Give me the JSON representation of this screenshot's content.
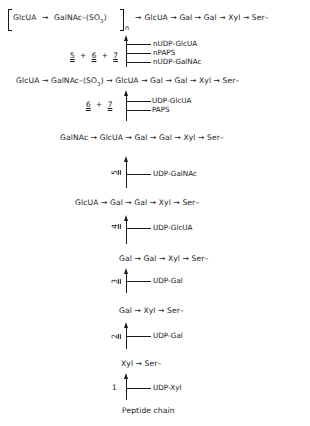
{
  "diagram": {
    "type": "biosynthesis-pathway",
    "arrow_glyph": "→",
    "rows": [
      {
        "id": "row8",
        "items": [
          "GlcUA",
          "GalNAc–(SO3)",
          "GlcUA",
          "Gal",
          "Gal",
          "Xyl",
          "Ser–"
        ],
        "repeat_subscript": "n"
      },
      {
        "id": "row7",
        "items": [
          "GlcUA",
          "GalNAc–(SO3)",
          "GlcUA",
          "Gal",
          "Gal",
          "Xyl",
          "Ser–"
        ]
      },
      {
        "id": "row6",
        "items": [
          "GalNAc",
          "GlcUA",
          "Gal",
          "Gal",
          "Xyl",
          "Ser–"
        ]
      },
      {
        "id": "row5",
        "items": [
          "GlcUA",
          "Gal",
          "Gal",
          "Xyl",
          "Ser–"
        ]
      },
      {
        "id": "row4",
        "items": [
          "Gal",
          "Gal",
          "Xyl",
          "Ser–"
        ]
      },
      {
        "id": "row3",
        "items": [
          "Gal",
          "Xyl",
          "Ser–"
        ]
      },
      {
        "id": "row2",
        "items": [
          "Xyl",
          "Ser–"
        ]
      },
      {
        "id": "row1",
        "label": "Peptide chain"
      }
    ],
    "steps": [
      {
        "enzyme": "5 + 6 + 7",
        "substrates": [
          "nUDP-GlcUA",
          "nPAPS",
          "nUDP-GalNAc"
        ]
      },
      {
        "enzyme": "6 + 7",
        "substrates": [
          "UDP-GlcUA",
          "PAPS"
        ]
      },
      {
        "enzyme": "5",
        "substrates": [
          "UDP-GalNAc"
        ]
      },
      {
        "enzyme": "4",
        "substrates": [
          "UDP-GlcUA"
        ]
      },
      {
        "enzyme": "3",
        "substrates": [
          "UDP-Gal"
        ]
      },
      {
        "enzyme": "2",
        "substrates": [
          "UDP-Gal"
        ]
      },
      {
        "enzyme": "1",
        "substrates": [
          "UDP-Xyl"
        ]
      }
    ]
  },
  "text": {
    "r8_a": "GlcUA",
    "r8_b": "GalNAc–(SO",
    "r8_b_sub": "3",
    "r8_b_end": ")",
    "r8_n": "n",
    "r8_rest": "GlcUA → Gal → Gal → Xyl → Ser–",
    "r7": "GlcUA → GalNAc–(SO",
    "r7_sub": "3",
    "r7_rest": ") → GlcUA → Gal → Gal → Xyl → Ser–",
    "r6": "GalNAc → GlcUA → Gal → Gal → Xyl → Ser–",
    "r5": "GlcUA → Gal → Gal → Xyl → Ser–",
    "r4": "Gal → Gal → Xyl → Ser–",
    "r3": "Gal → Xyl → Ser–",
    "r2": "Xyl → Ser–",
    "r1": "Peptide chain",
    "s7_n1": "5",
    "s7_plus1": "+",
    "s7_n2": "6",
    "s7_plus2": "+",
    "s7_n3": "7",
    "s7_l1": "nUDP-GlcUA",
    "s7_l2": "nPAPS",
    "s7_l3": "nUDP-GalNAc",
    "s6_n1": "6",
    "s6_plus": "+",
    "s6_n2": "7",
    "s6_l1": "UDP-GlcUA",
    "s6_l2": "PAPS",
    "s5_n": "5",
    "s5_l": "UDP-GalNAc",
    "s4_n": "4",
    "s4_l": "UDP-GlcUA",
    "s3_n": "3",
    "s3_l": "UDP-Gal",
    "s2_n": "2",
    "s2_l": "UDP-Gal",
    "s1_n": "1",
    "s1_l": "UDP-Xyl"
  }
}
